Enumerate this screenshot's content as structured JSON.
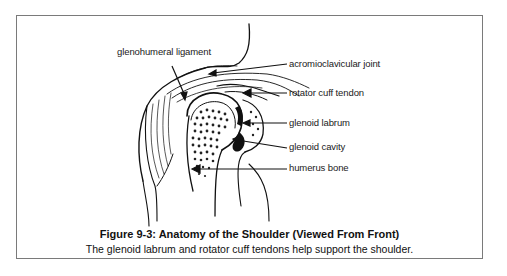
{
  "figure": {
    "title": "Figure 9-3: Anatomy of the Shoulder (Viewed From Front)",
    "subtitle": "The glenoid labrum and rotator cuff tendons help support the shoulder.",
    "labels": {
      "glenohumeral_ligament": "glenohumeral ligament",
      "acromioclavicular_joint": "acromioclavicular joint",
      "rotator_cuff_tendon": "rotator cuff tendon",
      "glenoid_labrum": "glenoid labrum",
      "glenoid_cavity": "glenoid cavity",
      "humerus_bone": "humerus bone"
    }
  }
}
